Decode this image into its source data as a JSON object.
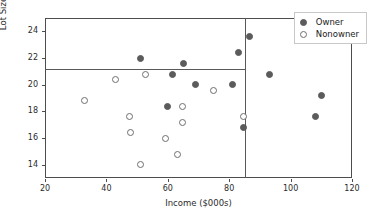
{
  "chart_data": {
    "type": "scatter",
    "title": "",
    "xlabel": "Income ($000s)",
    "ylabel": "Lot Size (000s, ft²)",
    "xlim": [
      20,
      120
    ],
    "ylim": [
      13.0,
      25.0
    ],
    "xticks": [
      20,
      40,
      60,
      80,
      100,
      120
    ],
    "yticks": [
      14,
      16,
      18,
      20,
      22,
      24
    ],
    "grid": false,
    "legend_position": "upper right",
    "reference_lines": [
      {
        "name": "income-split",
        "orientation": "vertical",
        "value": 85
      },
      {
        "name": "lotsize-split",
        "orientation": "horizontal",
        "value": 21.2,
        "x_extent": [
          20,
          85
        ]
      }
    ],
    "series": [
      {
        "name": "Owner",
        "marker": "filled-circle",
        "color": "#5b5b5b",
        "points": [
          {
            "x": 51,
            "y": 22.0
          },
          {
            "x": 65,
            "y": 21.6
          },
          {
            "x": 83,
            "y": 22.4
          },
          {
            "x": 61.5,
            "y": 20.8
          },
          {
            "x": 69,
            "y": 20.0
          },
          {
            "x": 81,
            "y": 20.0
          },
          {
            "x": 60,
            "y": 18.4
          },
          {
            "x": 86.5,
            "y": 23.6
          },
          {
            "x": 93,
            "y": 20.8
          },
          {
            "x": 110,
            "y": 19.2
          },
          {
            "x": 108,
            "y": 17.6
          },
          {
            "x": 84.5,
            "y": 16.8
          }
        ]
      },
      {
        "name": "Nonowner",
        "marker": "open-circle",
        "color": "#6e6e6e",
        "points": [
          {
            "x": 33,
            "y": 18.8
          },
          {
            "x": 43,
            "y": 20.4
          },
          {
            "x": 52.8,
            "y": 20.8
          },
          {
            "x": 47.4,
            "y": 17.6
          },
          {
            "x": 47.8,
            "y": 16.4
          },
          {
            "x": 51,
            "y": 14.0
          },
          {
            "x": 59.4,
            "y": 16.0
          },
          {
            "x": 63,
            "y": 14.8
          },
          {
            "x": 64.8,
            "y": 17.2
          },
          {
            "x": 64.8,
            "y": 18.4
          },
          {
            "x": 75,
            "y": 19.6
          },
          {
            "x": 84.5,
            "y": 17.6
          }
        ]
      }
    ]
  },
  "legend": {
    "entries": [
      {
        "label": "Owner",
        "marker": "filled-circle"
      },
      {
        "label": "Nonowner",
        "marker": "open-circle"
      }
    ]
  }
}
